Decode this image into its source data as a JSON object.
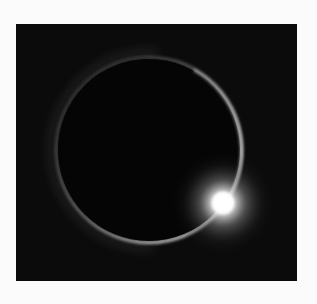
{
  "image": {
    "subject": "diamond ring solar eclipse",
    "alt": "Total solar eclipse showing the diamond ring effect: a thin glowing ring around the dark moon with a bright burst of light at the lower right",
    "colors": {
      "page_background": "#fbfbfb",
      "sky": "#0b0b0b",
      "moon": "#050505",
      "corona": "#cfcfcf",
      "diamond": "#ffffff"
    }
  }
}
